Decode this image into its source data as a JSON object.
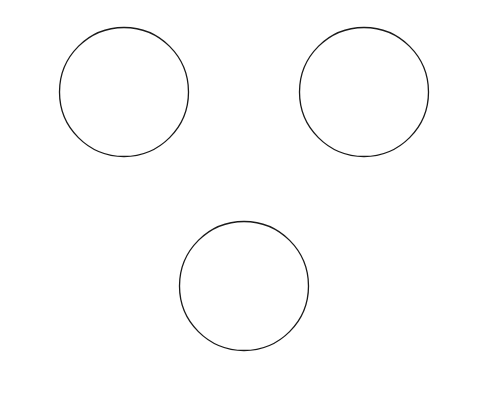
{
  "diagrams": [
    {
      "center": [
        124,
        92
      ],
      "top": "North",
      "bottom": "South",
      "left": {
        "name": "East",
        "sub": "(Following)"
      },
      "right": {
        "name": "West",
        "sub": "(Preceding)"
      },
      "degrees": {
        "n": "0º",
        "ne": "315º",
        "e": "270º",
        "se": "225º",
        "s": "180º",
        "sw": "135º",
        "w": "90º",
        "nw": "45º"
      },
      "caption_title": "Right-side up",
      "caption_sub": "(Naked eye; star maps)"
    },
    {
      "center": [
        364,
        92
      ],
      "top": "South",
      "bottom": "North",
      "left": {
        "name": "West",
        "sub": "(Preceding)"
      },
      "right": {
        "name": "East",
        "sub": "(Following)"
      },
      "degrees": {
        "n": "180º",
        "ne": "135º",
        "e": "90º",
        "se": "45º",
        "s": "0º",
        "sw": "315º",
        "w": "270º",
        "nw": "225º"
      },
      "caption_title": "Inverted",
      "caption_sub": "(Telescope without diagonal)"
    },
    {
      "center": [
        244,
        286
      ],
      "top": "North",
      "bottom": "South",
      "left": {
        "name": "West",
        "sub": "(Preceding)"
      },
      "right": {
        "name": "East",
        "sub": "(Following)"
      },
      "degrees": {
        "n": "0º",
        "ne": "45º",
        "e": "90º",
        "se": "135º",
        "s": "180º",
        "sw": "225º",
        "w": "270º",
        "nw": "315º"
      },
      "caption_title": "Right-side up and flipped",
      "caption_sub": "(Telescope with diagonal)"
    }
  ],
  "colors": {
    "stroke": "#1a1a1a",
    "text": "#3a3a3a"
  }
}
